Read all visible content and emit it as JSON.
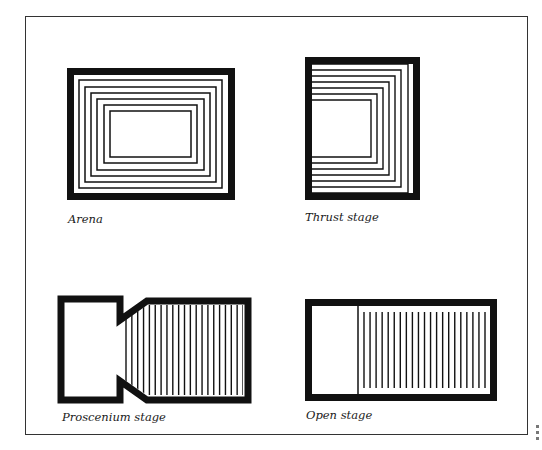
{
  "figure": {
    "diagrams": [
      {
        "id": "arena",
        "caption": "Arena",
        "caption_pos": [
          68,
          212
        ],
        "outer": {
          "x": 67,
          "y": 68,
          "w": 168,
          "h": 132,
          "border": 7
        },
        "rings": [
          {
            "x": 79,
            "y": 80,
            "w": 143,
            "h": 108
          },
          {
            "x": 85,
            "y": 87,
            "w": 131,
            "h": 95
          },
          {
            "x": 91,
            "y": 93,
            "w": 119,
            "h": 83
          },
          {
            "x": 97,
            "y": 99,
            "w": 107,
            "h": 71
          },
          {
            "x": 104,
            "y": 105,
            "w": 93,
            "h": 58
          },
          {
            "x": 110,
            "y": 111,
            "w": 81,
            "h": 46
          }
        ]
      },
      {
        "id": "thrust-stage",
        "caption": "Thrust stage",
        "caption_pos": [
          305,
          210
        ],
        "outer": {
          "x": 305,
          "y": 57,
          "w": 115,
          "h": 143,
          "border": 7
        },
        "u_lines": [
          {
            "right": 408,
            "top": 64,
            "bottom": 193
          },
          {
            "right": 401,
            "top": 70,
            "bottom": 187
          },
          {
            "right": 395,
            "top": 76,
            "bottom": 181
          },
          {
            "right": 389,
            "top": 82,
            "bottom": 175
          },
          {
            "right": 383,
            "top": 88,
            "bottom": 169
          },
          {
            "right": 377,
            "top": 94,
            "bottom": 163
          },
          {
            "right": 371,
            "top": 100,
            "bottom": 157
          }
        ],
        "stage_left": 312
      },
      {
        "id": "proscenium-stage",
        "caption": "Proscenium stage",
        "caption_pos": [
          62,
          410
        ],
        "outer_path": "M61,299 H120 V320 L147,301 H248 V400 H147 L120,381 V400 H61 Z",
        "border": 7,
        "lines_x_start": 126,
        "lines_x_end": 243,
        "line_count": 21,
        "line_top": 305,
        "line_bottom": 395
      },
      {
        "id": "open-stage",
        "caption": "Open stage",
        "caption_pos": [
          306,
          408
        ],
        "outer": {
          "x": 305,
          "y": 299,
          "w": 192,
          "h": 102,
          "border": 7
        },
        "divider_x": 358,
        "lines_x_start": 364,
        "lines_x_end": 485,
        "line_count": 21,
        "line_top": 312,
        "line_bottom": 388
      }
    ],
    "colors": {
      "ink": "#111111",
      "paper": "#ffffff",
      "frame": "#333333"
    }
  }
}
